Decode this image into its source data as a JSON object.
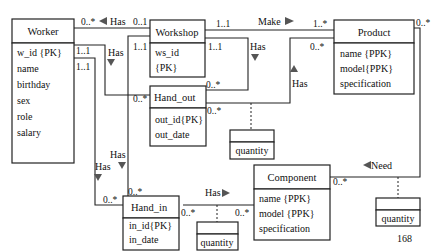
{
  "classes": {
    "worker": {
      "name": "Worker",
      "attributes": [
        "w_id {PK}",
        "name",
        "birthday",
        "sex",
        "role",
        "salary"
      ]
    },
    "workshop": {
      "name": "Workshop",
      "attributes": [
        "ws_id",
        "{PK}"
      ]
    },
    "product": {
      "name": "Product",
      "attributes": [
        "name {PPK}",
        "model{PPK}",
        "specification"
      ]
    },
    "hand_out": {
      "name": "Hand_out",
      "attributes": [
        "out_id{PK}",
        "out_date"
      ]
    },
    "hand_in": {
      "name": "Hand_in",
      "attributes": [
        "in_id{PK}",
        "in_date"
      ]
    },
    "component": {
      "name": "Component",
      "attributes": [
        "name {PPK}",
        "model {PPK}",
        "specification"
      ]
    },
    "assoc_handout": {
      "name": "",
      "attributes": [
        "quantity"
      ]
    },
    "assoc_handin": {
      "name": "",
      "attributes": [
        "quantity"
      ]
    },
    "assoc_need": {
      "name": "",
      "attributes": [
        "quantity"
      ]
    }
  },
  "associations": [
    {
      "label": "Has",
      "from": "Workshop",
      "to": "Worker",
      "mult_from": "0..1",
      "mult_to": "0..*"
    },
    {
      "label": "Make",
      "from": "Workshop",
      "to": "Product",
      "mult_from": "1..1",
      "mult_to": "1..*"
    },
    {
      "label": "Has",
      "from": "Worker",
      "to": "Hand_out",
      "mult_from": "1..1",
      "mult_to": "0..*"
    },
    {
      "label": "Has",
      "from": "Worker",
      "to": "Hand_in",
      "mult_from": "1..1",
      "mult_to": "0..*"
    },
    {
      "label": "Has",
      "from": "Workshop",
      "to": "Hand_in",
      "mult_from": "1..1",
      "mult_to": "0..*"
    },
    {
      "label": "Has",
      "from": "Workshop",
      "to": "Hand_out",
      "mult_from": "1..1",
      "mult_to": "0..*"
    },
    {
      "label": "Has",
      "from": "Hand_out",
      "to": "Product",
      "mult_from": "0..*",
      "mult_to": "0..*"
    },
    {
      "label": "Has",
      "from": "Hand_in",
      "to": "Component",
      "mult_from": "0..*",
      "mult_to": "0..*"
    },
    {
      "label": "Need",
      "from": "Product",
      "to": "Component",
      "mult_from": "0..*",
      "mult_to": "0..*"
    }
  ],
  "labels": {
    "has": "Has",
    "make": "Make",
    "need": "Need",
    "m_0_many": "0..*",
    "m_0_1": "0..1",
    "m_1_1": "1..1",
    "m_1_many": "1..*"
  },
  "page_number": "168"
}
